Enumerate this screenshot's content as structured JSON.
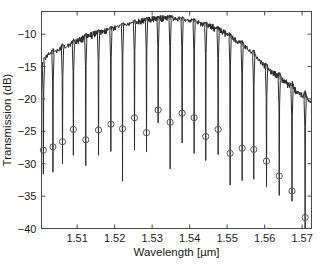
{
  "chart_data": {
    "type": "line",
    "title": "",
    "xlabel": "Wavelength [µm]",
    "ylabel": "Transmission (dB)",
    "xlim": [
      1.5005,
      1.5725
    ],
    "ylim": [
      -40,
      -6.5
    ],
    "xticks": [
      1.51,
      1.52,
      1.53,
      1.54,
      1.55,
      1.56,
      1.57
    ],
    "xticklabels": [
      "1.51",
      "1.52",
      "1.53",
      "1.54",
      "1.55",
      "1.56",
      "1.57"
    ],
    "yticks": [
      -10,
      -15,
      -20,
      -25,
      -30,
      -35,
      -40
    ],
    "yticklabels": [
      "−10",
      "−15",
      "−20",
      "−25",
      "−30",
      "−35",
      "−40"
    ],
    "grid": false,
    "legend": null,
    "line_color": "#2b2b2b",
    "marker_color": "#555555",
    "axis_color": "#4a4a4a",
    "background_color": "#ffffff",
    "series": [
      {
        "name": "envelope",
        "comment": "Gain envelope between resonance dips, sampled wavelength (um) / transmission (dB)",
        "x": [
          1.5007,
          1.5012,
          1.5018,
          1.5024,
          1.5031,
          1.5038,
          1.5046,
          1.5055,
          1.5064,
          1.5073,
          1.5083,
          1.5093,
          1.5104,
          1.5115,
          1.5126,
          1.5137,
          1.5148,
          1.5159,
          1.517,
          1.5181,
          1.5192,
          1.5203,
          1.5214,
          1.5225,
          1.5236,
          1.5247,
          1.5258,
          1.5269,
          1.528,
          1.5291,
          1.5302,
          1.5313,
          1.5324,
          1.5335,
          1.5346,
          1.5357,
          1.5368,
          1.5379,
          1.539,
          1.5401,
          1.5412,
          1.5423,
          1.5434,
          1.5445,
          1.5456,
          1.5467,
          1.5478,
          1.5489,
          1.55,
          1.5511,
          1.5522,
          1.5533,
          1.5544,
          1.5555,
          1.5566,
          1.5577,
          1.5588,
          1.5599,
          1.561,
          1.5621,
          1.5632,
          1.5643,
          1.5654,
          1.5665,
          1.5676,
          1.5687,
          1.5698,
          1.5709,
          1.5718
        ],
        "y": [
          -15.3,
          -14.2,
          -13.6,
          -13.2,
          -13.0,
          -12.9,
          -12.6,
          -12.3,
          -12.1,
          -11.9,
          -11.6,
          -11.3,
          -11.0,
          -10.7,
          -10.4,
          -10.2,
          -10.0,
          -9.8,
          -9.6,
          -9.4,
          -9.2,
          -9.0,
          -8.8,
          -8.6,
          -8.5,
          -8.3,
          -8.2,
          -8.0,
          -7.9,
          -7.8,
          -7.7,
          -7.6,
          -7.6,
          -7.5,
          -7.5,
          -7.6,
          -7.6,
          -7.7,
          -7.8,
          -7.9,
          -8.0,
          -8.2,
          -8.4,
          -8.6,
          -8.8,
          -9.1,
          -9.4,
          -9.7,
          -10.1,
          -10.5,
          -10.9,
          -11.3,
          -11.8,
          -12.3,
          -12.9,
          -13.5,
          -14.2,
          -14.9,
          -15.5,
          -16.0,
          -16.4,
          -16.9,
          -17.4,
          -17.9,
          -18.4,
          -18.9,
          -19.4,
          -19.9,
          -20.2
        ]
      },
      {
        "name": "resonance_dips",
        "comment": "Each dip: center wavelength (um), dip bottom transmission (dB), marker (circle) transmission (dB)",
        "dips": [
          {
            "x": 1.501,
            "bottom": -31.6,
            "marker": -27.9
          },
          {
            "x": 1.50355,
            "bottom": -31.3,
            "marker": -27.4
          },
          {
            "x": 1.5061,
            "bottom": -30.0,
            "marker": -26.6
          },
          {
            "x": 1.509,
            "bottom": -28.7,
            "marker": -24.7
          },
          {
            "x": 1.5123,
            "bottom": -30.3,
            "marker": -26.3
          },
          {
            "x": 1.5157,
            "bottom": -28.7,
            "marker": -24.8
          },
          {
            "x": 1.519,
            "bottom": -28.1,
            "marker": -23.9
          },
          {
            "x": 1.5221,
            "bottom": -32.7,
            "marker": -24.6
          },
          {
            "x": 1.5253,
            "bottom": -27.9,
            "marker": -22.9
          },
          {
            "x": 1.5285,
            "bottom": -28.2,
            "marker": -25.2
          },
          {
            "x": 1.5316,
            "bottom": -23.7,
            "marker": -21.7
          },
          {
            "x": 1.5348,
            "bottom": -30.8,
            "marker": -23.6
          },
          {
            "x": 1.538,
            "bottom": -26.8,
            "marker": -22.2
          },
          {
            "x": 1.5412,
            "bottom": -28.4,
            "marker": -22.9
          },
          {
            "x": 1.5443,
            "bottom": -29.5,
            "marker": -25.8
          },
          {
            "x": 1.5476,
            "bottom": -28.6,
            "marker": -24.7
          },
          {
            "x": 1.5508,
            "bottom": -33.3,
            "marker": -28.4
          },
          {
            "x": 1.554,
            "bottom": -32.6,
            "marker": -27.6
          },
          {
            "x": 1.5571,
            "bottom": -32.4,
            "marker": -27.8
          },
          {
            "x": 1.5605,
            "bottom": -33.6,
            "marker": -29.6
          },
          {
            "x": 1.5639,
            "bottom": -34.9,
            "marker": -31.9
          },
          {
            "x": 1.5673,
            "bottom": -35.8,
            "marker": -34.2
          },
          {
            "x": 1.5708,
            "bottom": -40.0,
            "marker": -38.3
          }
        ]
      }
    ]
  },
  "figure": {
    "caption_ghost": ""
  }
}
